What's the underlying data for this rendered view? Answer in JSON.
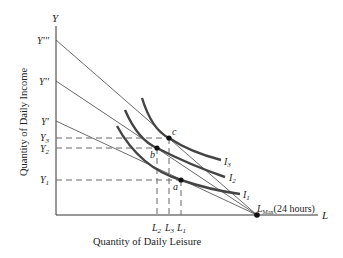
{
  "diagram": {
    "y_axis_symbol": "Y",
    "x_axis_symbol": "L",
    "y_axis_title": "Quantity of Daily Income",
    "x_axis_title": "Quantity of Daily Leisure",
    "budget_intercepts": [
      "Y'''",
      "Y''",
      "Y'"
    ],
    "income_levels": [
      "Y3",
      "Y2",
      "Y1"
    ],
    "leisure_levels": [
      "L2",
      "L3",
      "L1"
    ],
    "points": [
      "c",
      "b",
      "a"
    ],
    "indifference_curves": [
      "I3",
      "I2",
      "I1"
    ],
    "lmax_label": "L",
    "lmax_sub": "Max",
    "lmax_note": "(24 hours)"
  },
  "colors": {
    "axis": "#333333",
    "budget": "#444444",
    "curve": "#444444",
    "dash": "#666666"
  }
}
